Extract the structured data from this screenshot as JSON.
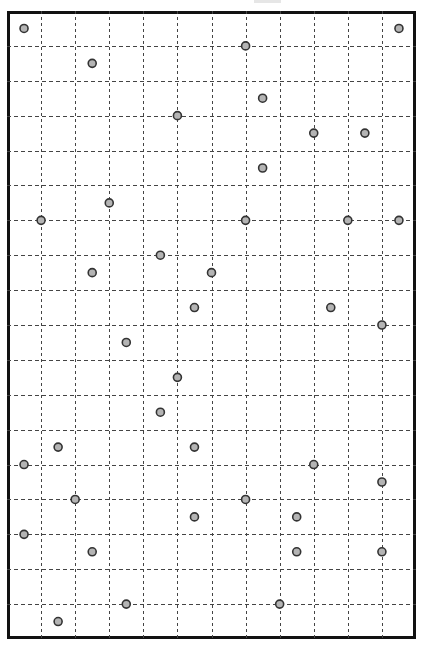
{
  "chart_data": {
    "type": "scatter",
    "title": "",
    "xlabel": "",
    "ylabel": "",
    "grid": true,
    "grid_style": "dashed",
    "columns": 12,
    "rows": 18,
    "units": "half-cell coordinates from top-left of frame (x: 0-24, y: 0-36)",
    "xlim": [
      0,
      24
    ],
    "ylim": [
      0,
      36
    ],
    "points": [
      {
        "x": 1,
        "y": 1
      },
      {
        "x": 23,
        "y": 1
      },
      {
        "x": 14,
        "y": 2
      },
      {
        "x": 5,
        "y": 3
      },
      {
        "x": 15,
        "y": 5
      },
      {
        "x": 10,
        "y": 6
      },
      {
        "x": 18,
        "y": 7
      },
      {
        "x": 21,
        "y": 7
      },
      {
        "x": 15,
        "y": 9
      },
      {
        "x": 6,
        "y": 11
      },
      {
        "x": 2,
        "y": 12
      },
      {
        "x": 14,
        "y": 12
      },
      {
        "x": 20,
        "y": 12
      },
      {
        "x": 23,
        "y": 12
      },
      {
        "x": 9,
        "y": 14
      },
      {
        "x": 5,
        "y": 15
      },
      {
        "x": 12,
        "y": 15
      },
      {
        "x": 11,
        "y": 17
      },
      {
        "x": 19,
        "y": 17
      },
      {
        "x": 22,
        "y": 18
      },
      {
        "x": 7,
        "y": 19
      },
      {
        "x": 10,
        "y": 21
      },
      {
        "x": 9,
        "y": 23
      },
      {
        "x": 3,
        "y": 25
      },
      {
        "x": 11,
        "y": 25
      },
      {
        "x": 1,
        "y": 26
      },
      {
        "x": 18,
        "y": 26
      },
      {
        "x": 22,
        "y": 27
      },
      {
        "x": 4,
        "y": 28
      },
      {
        "x": 14,
        "y": 28
      },
      {
        "x": 11,
        "y": 29
      },
      {
        "x": 17,
        "y": 29
      },
      {
        "x": 1,
        "y": 30
      },
      {
        "x": 5,
        "y": 31
      },
      {
        "x": 17,
        "y": 31
      },
      {
        "x": 22,
        "y": 31
      },
      {
        "x": 7,
        "y": 34
      },
      {
        "x": 16,
        "y": 34
      },
      {
        "x": 3,
        "y": 35
      }
    ],
    "marker": {
      "shape": "circle",
      "radius": 4,
      "fill": "#b4b4b4",
      "stroke": "#333333"
    },
    "legend": null
  },
  "style": {
    "frame_color": "#111111",
    "grid_color": "#444444",
    "background": "#ffffff"
  }
}
